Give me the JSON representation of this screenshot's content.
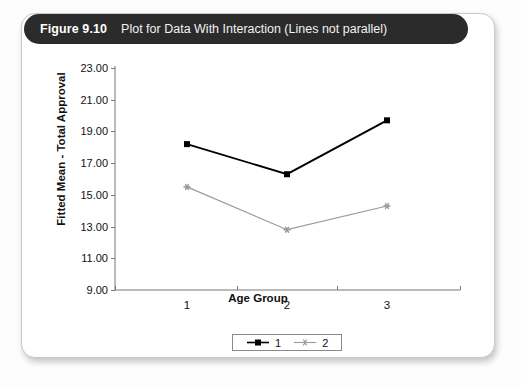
{
  "figure": {
    "number": "Figure 9.10",
    "caption": "Plot for Data With Interaction (Lines not parallel)"
  },
  "chart_data": {
    "type": "line",
    "title": "Plot for Data With Interaction (Lines not parallel)",
    "xlabel": "Age Group",
    "ylabel": "Fitted Mean - Total Approval",
    "categories": [
      "1",
      "2",
      "3"
    ],
    "series": [
      {
        "name": "1",
        "values": [
          18.2,
          16.3,
          19.7
        ],
        "color": "#000000",
        "marker": "square"
      },
      {
        "name": "2",
        "values": [
          15.5,
          12.8,
          14.3
        ],
        "color": "#9a9a9a",
        "marker": "star"
      }
    ],
    "ylim": [
      9.0,
      23.0
    ],
    "yticks": [
      "23.00",
      "21.00",
      "19.00",
      "17.00",
      "15.00",
      "13.00",
      "11.00",
      "9.00"
    ],
    "ytick_values": [
      23.0,
      21.0,
      19.0,
      17.0,
      15.0,
      13.0,
      11.0,
      9.0
    ],
    "xticks": [
      "1",
      "2",
      "3"
    ],
    "grid": false,
    "legend_position": "bottom-center",
    "legend_entries": [
      "1",
      "2"
    ]
  }
}
